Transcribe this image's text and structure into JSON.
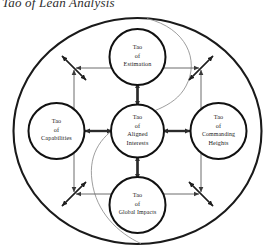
{
  "header": {
    "clipped_text": "Tao of Lean Analysis"
  },
  "diagram": {
    "type": "hub-and-spoke concept diagram",
    "outer_boundary": {
      "shape": "ellipse",
      "stroke_color": "#1a1a1a"
    },
    "center_node": {
      "id": "aligned-interests",
      "lines": [
        "Tao",
        "of",
        "Aligned",
        "Interests"
      ]
    },
    "satellite_nodes": [
      {
        "id": "estimation",
        "position": "top",
        "lines": [
          "Tao",
          "of",
          "Estimation"
        ]
      },
      {
        "id": "capabilities",
        "position": "left",
        "lines": [
          "Tao",
          "of",
          "Capabilities"
        ]
      },
      {
        "id": "commanding-heights",
        "position": "right",
        "lines": [
          "Tao",
          "of",
          "Commanding",
          "Heights"
        ]
      },
      {
        "id": "global-impacts",
        "position": "bottom",
        "lines": [
          "Tao",
          "of",
          "Global Impacts"
        ]
      }
    ],
    "connectors": {
      "spoke_style": "double-headed arrow",
      "corner_style": "diagonal double-headed arrow",
      "ring_style": "square ring of double-headed arrows",
      "spoke_color": "#2b2b2b",
      "ring_color": "#6d6d6d",
      "spiral_color": "#8a8a8a"
    }
  }
}
